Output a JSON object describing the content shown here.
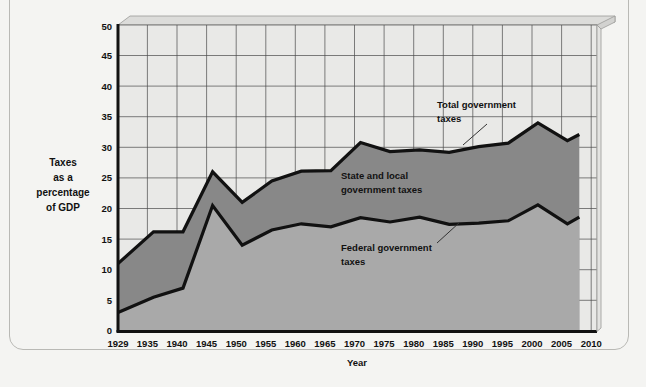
{
  "chart_data": {
    "type": "area",
    "title": "",
    "xlabel": "Year",
    "ylabel": "Taxes as a percentage of GDP",
    "ylabel_lines": [
      "Taxes",
      "as a",
      "percentage",
      "of GDP"
    ],
    "xlim": [
      1929,
      2010
    ],
    "ylim": [
      0,
      50
    ],
    "grid": true,
    "stacked": true,
    "legend_position": "inline-annotations",
    "xticks": [
      1929,
      1935,
      1940,
      1945,
      1950,
      1955,
      1960,
      1965,
      1970,
      1975,
      1980,
      1985,
      1990,
      1995,
      2000,
      2005,
      2010
    ],
    "yticks": [
      0,
      5,
      10,
      15,
      20,
      25,
      30,
      35,
      40,
      45,
      50
    ],
    "x": [
      1929,
      1935,
      1940,
      1945,
      1950,
      1955,
      1960,
      1965,
      1970,
      1975,
      1980,
      1985,
      1990,
      1995,
      2000,
      2005,
      2007
    ],
    "series": [
      {
        "name": "Federal government taxes",
        "color": "#a8a8a8",
        "values": [
          3.0,
          5.5,
          7.0,
          20.5,
          14.0,
          16.5,
          17.5,
          17.0,
          18.5,
          17.8,
          18.6,
          17.4,
          17.6,
          18.0,
          20.6,
          17.5,
          18.6
        ]
      },
      {
        "name": "State and local government taxes",
        "color": "#8a8a8a",
        "values": [
          8.0,
          10.7,
          9.2,
          5.5,
          7.0,
          8.0,
          8.6,
          9.2,
          12.3,
          11.5,
          11.0,
          11.8,
          12.5,
          12.7,
          13.4,
          13.6,
          13.5
        ]
      }
    ],
    "totals": {
      "name": "Total government taxes",
      "values": [
        11.0,
        16.2,
        16.2,
        26.0,
        21.0,
        24.5,
        26.1,
        26.2,
        30.8,
        29.3,
        29.6,
        29.2,
        30.1,
        30.7,
        34.0,
        31.1,
        32.1
      ]
    },
    "annotations": [
      {
        "id": "total",
        "label_lines": [
          "Total government",
          "taxes"
        ],
        "target_year": 1987,
        "target_value": 29.4
      },
      {
        "id": "state-local",
        "label_lines": [
          "State and local",
          "government taxes"
        ],
        "target_year": 1965,
        "target_value": 22.0
      },
      {
        "id": "federal",
        "label_lines": [
          "Federal government",
          "taxes"
        ],
        "target_year": 1988,
        "target_value": 18.0
      }
    ],
    "colors": {
      "federal_fill": "#a9a9a9",
      "state_local_fill": "#888888",
      "plot_background": "#e9e9e7",
      "gridline": "#4a4a4a",
      "line": "#111111",
      "top_band": "#dcdcda",
      "page_background": "#f4f4f2",
      "frame_border": "#b9b9b5"
    }
  }
}
